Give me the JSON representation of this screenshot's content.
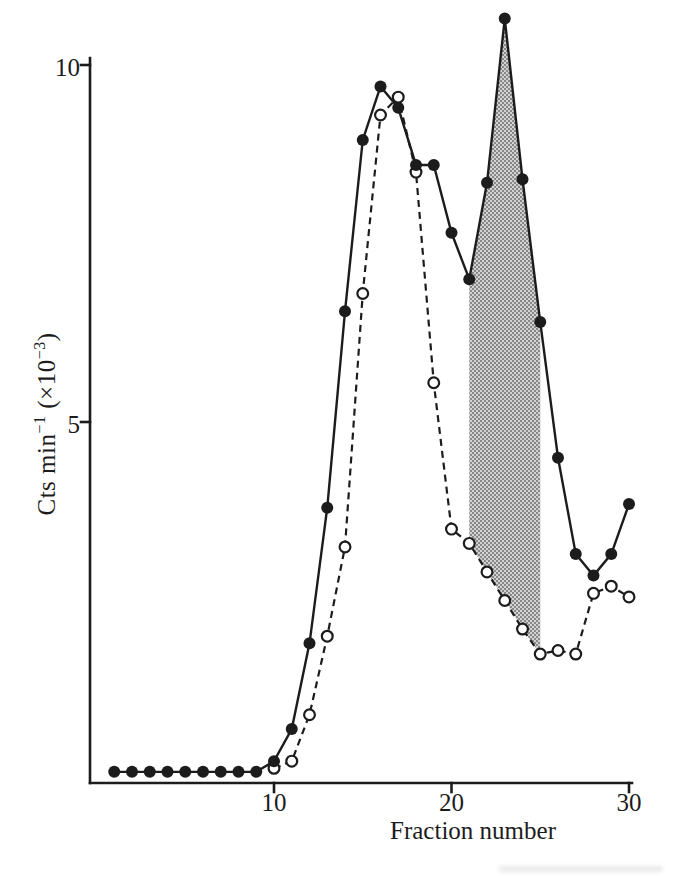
{
  "colors": {
    "ink": "#1c1c1c",
    "paper": "#ffffff",
    "shade_dot": "#6f6f6f",
    "shade_bg": "#d2d2d2"
  },
  "chart_data": {
    "type": "line",
    "title": "",
    "xlabel": "Fraction number",
    "ylabel": "Cts min⁻¹ (×10⁻³)",
    "ylabel_parts": [
      {
        "text": "Cts min"
      },
      {
        "text": "−1",
        "sup": true
      },
      {
        "text": " (×10",
        "sup": false
      },
      {
        "text": "−3",
        "sup": true
      },
      {
        "text": ")",
        "sup": false
      }
    ],
    "x_ticks": [
      10,
      20,
      30
    ],
    "y_ticks": [
      5,
      10
    ],
    "xlim": [
      0,
      30.3
    ],
    "ylim": [
      0,
      10.1
    ],
    "grid": false,
    "legend": "none",
    "series": [
      {
        "name": "filled-circles-solid",
        "marker": "filled-circle",
        "line_style": "solid",
        "x": [
          1,
          2,
          3,
          4,
          5,
          6,
          7,
          8,
          9,
          10,
          11,
          12,
          13,
          14,
          15,
          16,
          17,
          18,
          19,
          20,
          21,
          22,
          23,
          24,
          25,
          26,
          27,
          28,
          29,
          30
        ],
        "values": [
          0.1,
          0.1,
          0.1,
          0.1,
          0.1,
          0.1,
          0.1,
          0.1,
          0.1,
          0.25,
          0.7,
          1.9,
          3.8,
          6.55,
          8.95,
          9.7,
          9.4,
          8.6,
          8.6,
          7.65,
          7.0,
          8.35,
          10.65,
          8.4,
          6.4,
          4.5,
          3.15,
          2.85,
          3.15,
          3.85
        ]
      },
      {
        "name": "open-circles-dashed",
        "marker": "open-circle",
        "line_style": "dashed",
        "x": [
          10,
          11,
          12,
          13,
          14,
          15,
          16,
          17,
          18,
          19,
          20,
          21,
          22,
          23,
          24,
          25,
          26,
          27,
          28,
          29,
          30
        ],
        "values": [
          0.15,
          0.25,
          0.9,
          2.0,
          3.25,
          6.8,
          9.3,
          9.55,
          8.5,
          5.55,
          3.5,
          3.3,
          2.9,
          2.5,
          2.1,
          1.75,
          1.8,
          1.75,
          2.6,
          2.7,
          2.55
        ]
      }
    ],
    "shaded_region": {
      "style": "halftone-gray",
      "x_start": 21,
      "x_end": 25,
      "upper_series": 0,
      "lower_series": 1,
      "description": "Dotted halftone area between filled-circle curve (upper) and open-circle curve (lower) from fraction 21 to 25"
    }
  }
}
